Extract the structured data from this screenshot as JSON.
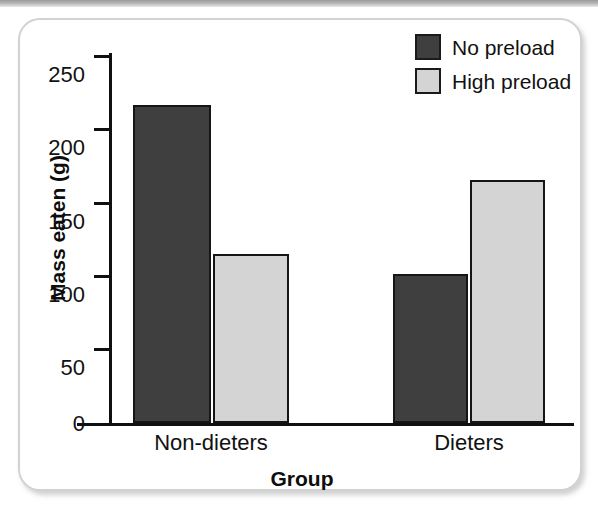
{
  "chart_data": {
    "type": "bar",
    "title": "",
    "xlabel": "Group",
    "ylabel": "Mass eaten (g)",
    "categories": [
      "Non-dieters",
      "Dieters"
    ],
    "series": [
      {
        "name": "No preload",
        "color": "#3f3f3f",
        "values": [
          216,
          101
        ]
      },
      {
        "name": "High preload",
        "color": "#d4d4d4",
        "values": [
          115,
          165
        ]
      }
    ],
    "ylim": [
      0,
      250
    ],
    "yticks": [
      0,
      50,
      100,
      150,
      200,
      250
    ],
    "ytick_labels": [
      "0",
      "50",
      "100",
      "150",
      "200",
      "250"
    ],
    "grid": false,
    "legend_position": "top-right",
    "axis_color": "#101010"
  },
  "legend": {
    "items": [
      {
        "label": "No preload",
        "swatch": "legend-swatch-no-preload"
      },
      {
        "label": "High preload",
        "swatch": "legend-swatch-high-preload"
      }
    ]
  },
  "axes": {
    "y_title": "Mass eaten (g)",
    "x_title": "Group",
    "y_labels": [
      "250",
      "200",
      "150",
      "100",
      "50",
      "0"
    ],
    "x_labels": [
      "Non-dieters",
      "Dieters"
    ]
  }
}
